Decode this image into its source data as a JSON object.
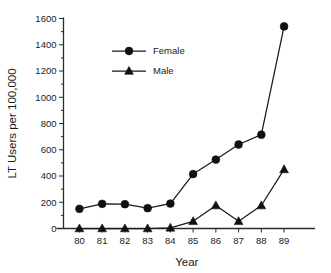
{
  "chart_data": {
    "type": "line",
    "title": "",
    "xlabel": "Year",
    "ylabel": "LT Users per 100,000",
    "categories": [
      "80",
      "81",
      "82",
      "83",
      "84",
      "85",
      "86",
      "87",
      "88",
      "89"
    ],
    "x": [
      80,
      81,
      82,
      83,
      84,
      85,
      86,
      87,
      88,
      89
    ],
    "series": [
      {
        "name": "Female",
        "marker": "circle",
        "values": [
          150,
          188,
          185,
          155,
          190,
          415,
          525,
          640,
          715,
          1540
        ]
      },
      {
        "name": "Male",
        "marker": "triangle",
        "values": [
          0,
          0,
          0,
          0,
          5,
          55,
          175,
          55,
          175,
          450
        ]
      }
    ],
    "ylim": [
      0,
      1600
    ],
    "xlim": [
      79.3,
      89.7
    ],
    "yticks": [
      0,
      200,
      400,
      600,
      800,
      1000,
      1200,
      1400,
      1600
    ],
    "ytick_labels": [
      "0",
      "200",
      "400",
      "600",
      "800",
      "1000",
      "1200",
      "1400",
      "1600"
    ],
    "yminor_step": 100,
    "grid": false,
    "legend_position": "upper-left-inside",
    "legend_entries": [
      "Female",
      "Male"
    ],
    "colors": {
      "line": "#1a1a1a",
      "marker": "#111111",
      "axis": "#2b2b2b",
      "background": "#ffffff"
    }
  }
}
